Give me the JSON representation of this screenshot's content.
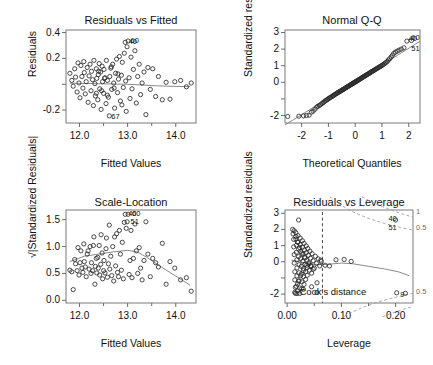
{
  "figure": {
    "kind": "r-regression-diagnostics",
    "panel_count": 4,
    "background": "#ffffff",
    "point_color": "#2b2b2b",
    "smoother_color": "#8a8a8a",
    "reference_color": "#4a4a4a"
  },
  "chart_data": [
    {
      "type": "scatter",
      "id": "residuals-vs-fitted",
      "title": "Residuals vs Fitted",
      "xlabel": "Fitted Values",
      "ylabel": "Residuals",
      "xlim": [
        11.72,
        14.42
      ],
      "ylim": [
        -0.3,
        0.42
      ],
      "xticks": [
        12.0,
        13.0,
        14.0
      ],
      "xticklabels": [
        "12.0",
        "13.0",
        "14.0"
      ],
      "xminorticks": [
        12.5,
        13.5
      ],
      "yticks": [
        0.4,
        0.2,
        0.0,
        -0.2
      ],
      "yticklabels": [
        "0.4",
        "0.2",
        "",
        "-0.2"
      ],
      "grid": false,
      "annotations": [
        {
          "text": "40",
          "x": 12.98,
          "y": 0.325
        },
        {
          "text": "60",
          "x": 13.02,
          "y": 0.335
        },
        {
          "text": "67",
          "x": 12.62,
          "y": -0.255
        }
      ],
      "smoother": {
        "name": "lowess",
        "x": [
          11.8,
          12.1,
          12.4,
          12.7,
          13.0,
          13.3,
          13.6,
          13.9,
          14.3
        ],
        "y": [
          0.008,
          0.006,
          0.004,
          0.002,
          0.0,
          -0.006,
          -0.012,
          -0.016,
          -0.018
        ]
      },
      "x": [
        11.8,
        11.84,
        11.87,
        11.9,
        11.92,
        11.95,
        11.97,
        11.99,
        12.01,
        12.03,
        12.05,
        12.07,
        12.09,
        12.1,
        12.12,
        12.14,
        12.16,
        12.18,
        12.2,
        12.22,
        12.24,
        12.25,
        12.27,
        12.29,
        12.3,
        12.32,
        12.33,
        12.35,
        12.36,
        12.38,
        12.39,
        12.41,
        12.42,
        12.44,
        12.45,
        12.47,
        12.48,
        12.5,
        12.51,
        12.53,
        12.55,
        12.56,
        12.58,
        12.6,
        12.62,
        12.63,
        12.65,
        12.67,
        12.69,
        12.71,
        12.73,
        12.75,
        12.77,
        12.79,
        12.81,
        12.83,
        12.85,
        12.87,
        12.89,
        12.91,
        12.93,
        12.95,
        12.97,
        12.99,
        13.01,
        13.03,
        13.05,
        13.07,
        13.09,
        13.12,
        13.15,
        13.18,
        13.21,
        13.24,
        13.27,
        13.3,
        13.34,
        13.38,
        13.42,
        13.47,
        13.52,
        13.58,
        13.64,
        13.72,
        13.8,
        13.88,
        13.98,
        14.1,
        14.22,
        14.32,
        12.35,
        12.4,
        12.46,
        12.52,
        12.58,
        12.66,
        12.72,
        12.8,
        12.88,
        12.96
      ],
      "y": [
        0.085,
        0.03,
        -0.015,
        0.12,
        0.055,
        -0.06,
        0.165,
        0.01,
        -0.105,
        0.145,
        0.06,
        -0.03,
        0.175,
        0.09,
        -0.075,
        0.02,
        0.13,
        -0.14,
        0.065,
        0.155,
        -0.05,
        0.1,
        0.035,
        -0.165,
        0.185,
        0.005,
        -0.09,
        0.12,
        0.045,
        -0.12,
        0.075,
        0.16,
        -0.035,
        0.095,
        -0.195,
        0.14,
        0.02,
        -0.07,
        0.115,
        0.05,
        -0.15,
        0.185,
        0.03,
        -0.1,
        -0.245,
        0.06,
        0.125,
        -0.04,
        0.155,
        0.01,
        -0.185,
        0.085,
        0.195,
        -0.065,
        0.04,
        0.215,
        -0.13,
        0.07,
        0.17,
        -0.025,
        0.24,
        0.325,
        -0.21,
        0.29,
        0.335,
        0.05,
        -0.11,
        0.21,
        -0.035,
        0.115,
        0.26,
        -0.145,
        0.06,
        0.155,
        -0.08,
        0.01,
        0.095,
        -0.235,
        0.13,
        -0.04,
        0.12,
        -0.095,
        0.06,
        -0.12,
        0.015,
        -0.115,
        0.02,
        0.03,
        -0.02,
        0.01,
        -0.07,
        0.1,
        -0.05,
        0.045,
        -0.085,
        0.135,
        -0.03,
        0.08,
        -0.16,
        0.025
      ]
    },
    {
      "type": "scatter",
      "id": "normal-qq",
      "title": "Normal Q-Q",
      "xlabel": "Theoretical Quantiles",
      "ylabel": "Standardized residuals",
      "xlim": [
        -2.62,
        2.42
      ],
      "ylim": [
        -2.45,
        3.15
      ],
      "xticks": [
        -2,
        -1,
        0,
        1,
        2
      ],
      "xticklabels": [
        "-2",
        "-1",
        "0",
        "1",
        "2"
      ],
      "yticks": [
        3,
        2,
        1,
        0,
        -1,
        -2
      ],
      "yticklabels": [
        "3",
        "2",
        "1",
        "0",
        "",
        "-2"
      ],
      "grid": false,
      "reference_line": {
        "slope": 1.0,
        "intercept": 0.05
      },
      "annotations": [
        {
          "text": "40",
          "x": 1.92,
          "y": 2.62
        },
        {
          "text": "60",
          "x": 2.02,
          "y": 2.66
        },
        {
          "text": "51",
          "x": 2.02,
          "y": 2.02
        }
      ],
      "x": [
        -2.52,
        -2.1,
        -1.93,
        -1.82,
        -1.72,
        -1.64,
        -1.57,
        -1.5,
        -1.44,
        -1.39,
        -1.34,
        -1.29,
        -1.24,
        -1.2,
        -1.16,
        -1.12,
        -1.08,
        -1.04,
        -1.01,
        -0.97,
        -0.94,
        -0.91,
        -0.87,
        -0.84,
        -0.81,
        -0.78,
        -0.75,
        -0.72,
        -0.69,
        -0.66,
        -0.64,
        -0.61,
        -0.58,
        -0.55,
        -0.53,
        -0.5,
        -0.47,
        -0.45,
        -0.42,
        -0.4,
        -0.37,
        -0.34,
        -0.32,
        -0.29,
        -0.27,
        -0.24,
        -0.22,
        -0.19,
        -0.17,
        -0.14,
        -0.12,
        -0.09,
        -0.07,
        -0.05,
        -0.02,
        0.0,
        0.02,
        0.05,
        0.07,
        0.09,
        0.12,
        0.14,
        0.17,
        0.19,
        0.22,
        0.24,
        0.27,
        0.29,
        0.32,
        0.34,
        0.37,
        0.4,
        0.42,
        0.45,
        0.47,
        0.5,
        0.53,
        0.55,
        0.58,
        0.61,
        0.64,
        0.66,
        0.69,
        0.72,
        0.75,
        0.78,
        0.81,
        0.84,
        0.87,
        0.91,
        0.94,
        0.97,
        1.01,
        1.04,
        1.08,
        1.12,
        1.16,
        1.2,
        1.24,
        1.29,
        1.34,
        1.39,
        1.44,
        1.5,
        1.57,
        1.64,
        1.72,
        1.82,
        1.93,
        2.1
      ],
      "y": [
        -2.06,
        -2.04,
        -2.02,
        -2.0,
        -1.98,
        -1.8,
        -1.74,
        -1.62,
        -1.5,
        -1.44,
        -1.4,
        -1.34,
        -1.28,
        -1.22,
        -1.18,
        -1.12,
        -1.08,
        -1.04,
        -1.0,
        -0.96,
        -0.92,
        -0.9,
        -0.86,
        -0.82,
        -0.8,
        -0.76,
        -0.73,
        -0.7,
        -0.67,
        -0.64,
        -0.62,
        -0.59,
        -0.56,
        -0.53,
        -0.51,
        -0.48,
        -0.45,
        -0.43,
        -0.4,
        -0.38,
        -0.35,
        -0.32,
        -0.3,
        -0.27,
        -0.25,
        -0.22,
        -0.2,
        -0.17,
        -0.15,
        -0.12,
        -0.1,
        -0.07,
        -0.05,
        -0.03,
        -0.01,
        0.02,
        0.04,
        0.07,
        0.09,
        0.11,
        0.14,
        0.16,
        0.19,
        0.21,
        0.24,
        0.26,
        0.29,
        0.31,
        0.34,
        0.36,
        0.39,
        0.42,
        0.44,
        0.47,
        0.49,
        0.52,
        0.55,
        0.57,
        0.6,
        0.63,
        0.66,
        0.68,
        0.71,
        0.74,
        0.77,
        0.8,
        0.83,
        0.86,
        0.89,
        0.93,
        0.96,
        0.99,
        1.03,
        1.06,
        1.1,
        1.16,
        1.2,
        1.26,
        1.34,
        1.42,
        1.52,
        1.62,
        1.74,
        1.82,
        1.88,
        1.94,
        2.0,
        2.08,
        2.48,
        2.52
      ]
    },
    {
      "type": "scatter",
      "id": "scale-location",
      "title": "Scale-Location",
      "xlabel": "Fitted Values",
      "ylabel": "√|Standardized Residuals|",
      "xlim": [
        11.72,
        14.42
      ],
      "ylim": [
        -0.05,
        1.68
      ],
      "xticks": [
        12.0,
        13.0,
        14.0
      ],
      "xticklabels": [
        "12.0",
        "13.0",
        "14.0"
      ],
      "xminorticks": [
        12.5,
        13.5
      ],
      "yticks": [
        1.5,
        1.0,
        0.5,
        0.0
      ],
      "yticklabels": [
        "1.5",
        "1.0",
        "0.5",
        "0.0"
      ],
      "grid": false,
      "annotations": [
        {
          "text": "40",
          "x": 12.97,
          "y": 1.6
        },
        {
          "text": "60",
          "x": 13.05,
          "y": 1.6
        },
        {
          "text": "51",
          "x": 13.02,
          "y": 1.46
        }
      ],
      "smoother": {
        "name": "lowess",
        "x": [
          11.8,
          12.1,
          12.4,
          12.7,
          13.0,
          13.2,
          13.4,
          13.7,
          14.0,
          14.3
        ],
        "y": [
          0.72,
          0.82,
          0.86,
          0.9,
          0.93,
          0.9,
          0.8,
          0.62,
          0.45,
          0.28
        ]
      },
      "x": [
        11.8,
        11.84,
        11.87,
        11.9,
        11.92,
        11.95,
        11.97,
        11.99,
        12.01,
        12.03,
        12.05,
        12.07,
        12.09,
        12.1,
        12.12,
        12.14,
        12.16,
        12.18,
        12.2,
        12.22,
        12.24,
        12.25,
        12.27,
        12.29,
        12.3,
        12.32,
        12.33,
        12.35,
        12.36,
        12.38,
        12.39,
        12.41,
        12.42,
        12.44,
        12.45,
        12.47,
        12.48,
        12.5,
        12.51,
        12.53,
        12.55,
        12.56,
        12.58,
        12.6,
        12.62,
        12.63,
        12.65,
        12.67,
        12.69,
        12.71,
        12.73,
        12.75,
        12.77,
        12.79,
        12.81,
        12.83,
        12.85,
        12.87,
        12.89,
        12.91,
        12.93,
        12.95,
        12.97,
        12.99,
        13.01,
        13.03,
        13.05,
        13.07,
        13.09,
        13.12,
        13.15,
        13.18,
        13.21,
        13.24,
        13.27,
        13.3,
        13.34,
        13.38,
        13.42,
        13.47,
        13.52,
        13.58,
        13.64,
        13.72,
        13.8,
        13.88,
        13.98,
        14.1,
        14.22,
        14.32
      ],
      "y": [
        0.56,
        0.53,
        0.2,
        0.76,
        0.68,
        0.55,
        0.98,
        0.47,
        0.7,
        0.92,
        0.6,
        0.52,
        1.05,
        0.72,
        0.62,
        0.44,
        0.86,
        0.92,
        0.58,
        1.0,
        0.5,
        0.7,
        0.55,
        1.02,
        1.18,
        0.3,
        0.63,
        0.78,
        0.51,
        0.8,
        0.6,
        1.02,
        0.47,
        0.67,
        1.22,
        0.88,
        0.4,
        0.55,
        0.74,
        0.51,
        0.96,
        1.16,
        0.43,
        0.68,
        1.4,
        0.58,
        0.82,
        0.46,
        1.0,
        0.36,
        1.18,
        0.64,
        1.24,
        0.52,
        0.44,
        1.3,
        0.86,
        0.56,
        1.08,
        0.4,
        1.45,
        1.6,
        1.34,
        1.46,
        1.6,
        0.48,
        0.74,
        1.3,
        0.42,
        0.78,
        1.42,
        0.92,
        0.5,
        0.98,
        0.6,
        0.38,
        0.74,
        1.46,
        0.86,
        0.44,
        0.78,
        0.7,
        0.62,
        1.06,
        0.3,
        0.72,
        0.6,
        0.38,
        0.42,
        0.17
      ]
    },
    {
      "type": "scatter",
      "id": "residuals-vs-leverage",
      "title": "Residuals vs Leverage",
      "xlabel": "Leverage",
      "ylabel": "Standardized residuals",
      "xlim": [
        -0.004,
        0.232
      ],
      "ylim": [
        -2.55,
        3.2
      ],
      "xticks": [
        0.0,
        0.1,
        0.2
      ],
      "xticklabels": [
        "0.00",
        "0.10",
        "0.20"
      ],
      "xminorticks": [
        0.05,
        0.15
      ],
      "yticks": [
        3,
        2,
        1,
        0,
        -1,
        -2
      ],
      "yticklabels": [
        "3",
        "2",
        "1",
        "0",
        "",
        "-2"
      ],
      "grid": false,
      "cooks_label": "Cook's distance",
      "cooks_contours": [
        "1",
        "0.5",
        "0.5"
      ],
      "leverage_cutoff": 0.065,
      "annotations": [
        {
          "text": "40",
          "x": 0.183,
          "y": 2.62
        },
        {
          "text": "51",
          "x": 0.183,
          "y": 2.06
        },
        {
          "text": "9",
          "x": 0.205,
          "y": -2.05
        }
      ],
      "smoother": {
        "name": "lowess",
        "x": [
          0.008,
          0.02,
          0.035,
          0.05,
          0.065,
          0.08,
          0.1,
          0.12,
          0.15,
          0.18,
          0.205,
          0.225
        ],
        "y": [
          0.1,
          0.02,
          -0.08,
          -0.16,
          -0.18,
          -0.14,
          -0.08,
          -0.12,
          -0.28,
          -0.45,
          -0.62,
          -0.86
        ]
      },
      "x": [
        0.01,
        0.011,
        0.012,
        0.012,
        0.013,
        0.013,
        0.014,
        0.014,
        0.015,
        0.015,
        0.016,
        0.016,
        0.017,
        0.017,
        0.018,
        0.018,
        0.018,
        0.019,
        0.019,
        0.02,
        0.02,
        0.021,
        0.021,
        0.022,
        0.022,
        0.022,
        0.023,
        0.023,
        0.024,
        0.024,
        0.025,
        0.025,
        0.026,
        0.026,
        0.027,
        0.027,
        0.028,
        0.028,
        0.029,
        0.029,
        0.03,
        0.03,
        0.031,
        0.031,
        0.032,
        0.032,
        0.033,
        0.034,
        0.034,
        0.035,
        0.035,
        0.036,
        0.037,
        0.037,
        0.038,
        0.039,
        0.04,
        0.041,
        0.042,
        0.043,
        0.044,
        0.045,
        0.046,
        0.048,
        0.05,
        0.052,
        0.054,
        0.057,
        0.06,
        0.063,
        0.013,
        0.014,
        0.016,
        0.017,
        0.019,
        0.021,
        0.023,
        0.025,
        0.027,
        0.03,
        0.033,
        0.036,
        0.04,
        0.044,
        0.048,
        0.055,
        0.062,
        0.07,
        0.078,
        0.09,
        0.105,
        0.118,
        0.2,
        0.202,
        0.218,
        0.021,
        0.045,
        0.055,
        0.03,
        0.018
      ],
      "y": [
        2.0,
        1.72,
        1.38,
        0.92,
        0.44,
        -0.08,
        -0.62,
        -1.12,
        -1.58,
        -1.95,
        1.8,
        1.4,
        1.02,
        0.58,
        0.12,
        -0.38,
        -0.88,
        -1.36,
        -1.8,
        1.62,
        1.2,
        0.78,
        0.32,
        -0.18,
        -0.68,
        -1.18,
        -1.62,
        -1.96,
        1.46,
        1.06,
        0.64,
        0.2,
        -0.28,
        -0.76,
        -1.24,
        -1.66,
        1.3,
        0.9,
        0.48,
        0.04,
        -0.42,
        -0.92,
        -1.4,
        1.14,
        0.72,
        0.28,
        -0.16,
        -0.62,
        -1.1,
        0.98,
        0.56,
        0.1,
        -0.36,
        -0.84,
        0.82,
        0.4,
        -0.06,
        -0.52,
        0.66,
        0.22,
        -0.24,
        -0.7,
        0.5,
        0.06,
        -0.4,
        0.34,
        -0.1,
        0.18,
        -0.26,
        0.02,
        1.92,
        -1.88,
        1.56,
        -1.52,
        1.22,
        -1.2,
        0.88,
        -0.86,
        0.54,
        -0.54,
        0.24,
        -0.22,
        -0.14,
        -0.3,
        -0.46,
        -1.3,
        0.1,
        -0.22,
        -0.26,
        0.12,
        0.14,
        0.02,
        2.58,
        -1.92,
        -1.95,
        2.58,
        -1.55,
        -1.9,
        -1.7,
        -1.96
      ]
    }
  ]
}
